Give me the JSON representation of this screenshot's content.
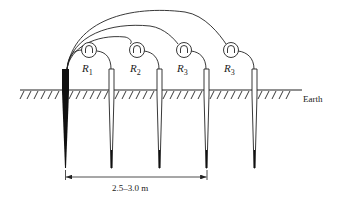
{
  "diagram": {
    "type": "earth-resistance-test-setup",
    "ground_label": "Earth",
    "dimension_label": "2.5–3.0 m",
    "meters": [
      {
        "id": "R1",
        "symbol": "R",
        "subscript": "1"
      },
      {
        "id": "R2",
        "symbol": "R",
        "subscript": "2"
      },
      {
        "id": "R3a",
        "symbol": "R",
        "subscript": "3"
      },
      {
        "id": "R3b",
        "symbol": "R",
        "subscript": "3"
      }
    ],
    "electrodes": [
      {
        "id": "main-electrode",
        "style": "solid-black"
      },
      {
        "id": "test-electrode-1",
        "style": "outline"
      },
      {
        "id": "test-electrode-2",
        "style": "outline"
      },
      {
        "id": "test-electrode-3",
        "style": "outline"
      },
      {
        "id": "test-electrode-4",
        "style": "outline"
      }
    ],
    "colors": {
      "ink": "#222222",
      "background": "#ffffff"
    }
  }
}
